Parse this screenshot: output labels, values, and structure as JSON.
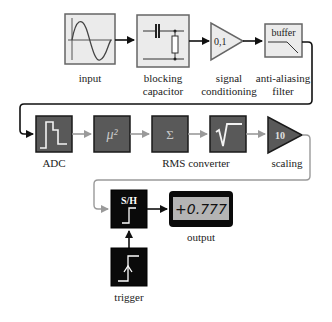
{
  "colors": {
    "light_block_fill": "#ebebeb",
    "light_block_stroke": "#666666",
    "dark_block_fill": "#595959",
    "dark_block_stroke": "#1a1a1a",
    "gray_connector": "#9a9a9a",
    "black_connector": "#111111",
    "display_fill": "#b4b4b4"
  },
  "row1": {
    "input": {
      "label": "input",
      "icon": "sine-wave"
    },
    "blocking_capacitor": {
      "label_line1": "blocking",
      "label_line2": "capacitor",
      "icon": "capacitor-resistor"
    },
    "signal_conditioning": {
      "label_line1": "signal",
      "label_line2": "conditioning",
      "gain": "0,1"
    },
    "anti_aliasing_filter": {
      "label_line1": "anti-aliasing",
      "label_line2": "filter",
      "text": "buffer",
      "icon": "lowpass-slope"
    }
  },
  "row2": {
    "adc": {
      "label": "ADC",
      "icon": "staircase"
    },
    "square": {
      "text": "μ²"
    },
    "sum": {
      "text": "Σ"
    },
    "sqrt": {
      "text": "√"
    },
    "rms_label": "RMS converter",
    "scaling": {
      "label": "scaling",
      "gain": "10"
    }
  },
  "row3": {
    "sample_hold": {
      "text": "S/H",
      "icon": "step"
    },
    "output": {
      "label": "output",
      "value": "+0.777"
    },
    "trigger": {
      "label": "trigger",
      "icon": "rising-edge"
    }
  }
}
